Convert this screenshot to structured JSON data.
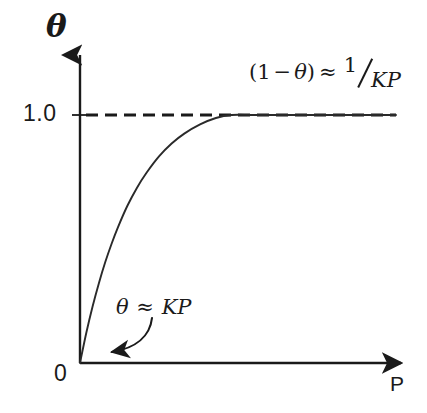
{
  "figure": {
    "kind": "langmuir-adsorption-isotherm",
    "background_color": "#ffffff",
    "ink_color": "#1a1a1a"
  },
  "axes": {
    "y_label": "θ",
    "x_label": "P",
    "origin_label": "0",
    "y_tick_label": "1.0"
  },
  "annotations": {
    "high_pressure": {
      "open_paren": "(",
      "one": "1",
      "minus": "−",
      "theta": "θ",
      "close_paren": ")",
      "approx": "≈",
      "numerator": "1",
      "denominator": "KP",
      "full_text": "(1 − θ) ≈ 1/KP"
    },
    "low_pressure": {
      "theta": "θ",
      "approx": "≈",
      "rhs": "KP",
      "full_text": "θ ≈ KP"
    }
  },
  "chart_data": {
    "type": "line",
    "title": "",
    "xlabel": "P",
    "ylabel": "θ",
    "xlim": [
      0,
      1
    ],
    "ylim": [
      0,
      1.22
    ],
    "grid": false,
    "legend": null,
    "y_ticks": [
      {
        "value": 1.0,
        "label": "1.0"
      }
    ],
    "x_ticks": [
      {
        "value": 0,
        "label": "0"
      }
    ],
    "equation": "theta = K*P / (1 + K*P)",
    "series": [
      {
        "name": "fractional coverage θ(P)",
        "style": "solid",
        "x": [
          0.0,
          0.02,
          0.04,
          0.06,
          0.08,
          0.1,
          0.12,
          0.15,
          0.18,
          0.21,
          0.25,
          0.29,
          0.33,
          0.38,
          0.43,
          0.48,
          0.54,
          0.6,
          0.66,
          0.72,
          0.78,
          0.84,
          0.9,
          0.96,
          1.0
        ],
        "y": [
          0.0,
          0.122,
          0.229,
          0.323,
          0.407,
          0.481,
          0.547,
          0.634,
          0.706,
          0.766,
          0.833,
          0.885,
          0.925,
          0.962,
          0.988,
          1.0,
          1.0,
          1.0,
          1.0,
          1.0,
          1.0,
          1.0,
          1.0,
          1.0,
          1.0
        ]
      },
      {
        "name": "saturation asymptote θ = 1",
        "style": "dashed",
        "x": [
          0.0,
          1.0
        ],
        "y": [
          1.0,
          1.0
        ]
      }
    ],
    "notes": [
      "Low-pressure limit: θ ≈ KP (initial linear rise from origin)",
      "High-pressure limit: (1 − θ) ≈ 1/KP (approach to saturation)"
    ]
  }
}
